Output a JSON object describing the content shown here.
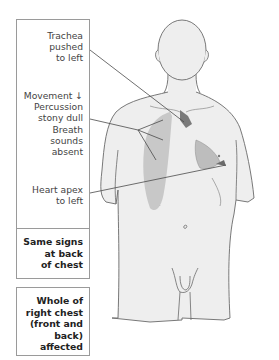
{
  "diagram": {
    "title_hint": "Signs of right-sided pleural effusion / massive consolidation",
    "annotations": [
      {
        "id": "trachea",
        "text": "Trachea\npushed\nto left"
      },
      {
        "id": "chest-signs",
        "text": "Movement ↓\nPercussion\nstony dull\nBreath\nsounds\nabsent"
      },
      {
        "id": "heart-apex",
        "text": "Heart apex\nto left"
      }
    ],
    "notes": [
      {
        "id": "back",
        "text": "Same signs\nat back\nof chest"
      },
      {
        "id": "whole",
        "text": "Whole of\nright chest\n(front and\nback) affected"
      }
    ],
    "colors": {
      "body_fill": "#eeeeee",
      "outline": "#6a6a6a",
      "affected_area": "#c8c8c8",
      "trachea": "#7a7a7a",
      "heart": "#bdbdbd",
      "leader_line": "#4a4a4a",
      "box_border": "#9a9a9a"
    }
  }
}
